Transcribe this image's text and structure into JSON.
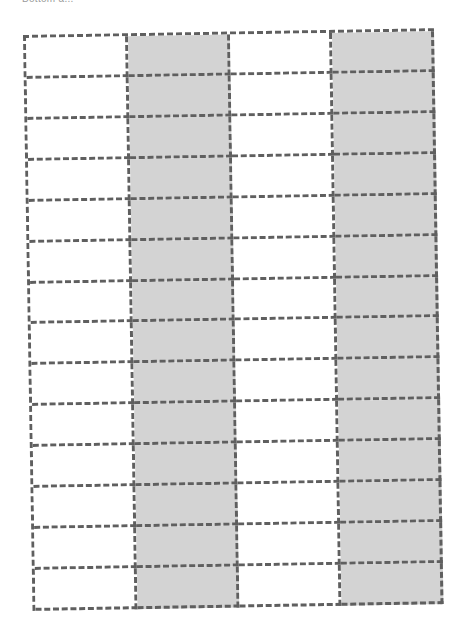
{
  "caption": {
    "text": "Bottom a..."
  },
  "grid": {
    "columns": 4,
    "rows": 14,
    "shaded_columns": [
      2,
      4
    ],
    "colors": {
      "shaded_fill": "#d3d3d3",
      "plain_fill": "#ffffff",
      "dash_border": "#5f5f5f"
    },
    "border_style": "dashed"
  }
}
